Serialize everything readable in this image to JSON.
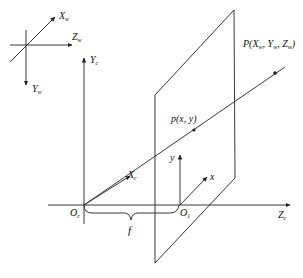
{
  "diagram": {
    "world_axes": {
      "x_label": "X",
      "x_sub": "w",
      "y_label": "Y",
      "y_sub": "w",
      "z_label": "Z",
      "z_sub": "w"
    },
    "camera_axes": {
      "x_label": "X",
      "x_sub": "c",
      "y_label": "Y",
      "y_sub": "c",
      "z_label": "Z",
      "z_sub": "c",
      "origin_label": "O",
      "origin_sub": "c"
    },
    "image_plane": {
      "x_label": "x",
      "y_label": "y",
      "origin_label": "O",
      "origin_sub": "1"
    },
    "points": {
      "world_point": "P(X",
      "world_point_full": "P(Xw, Yw, Zw)",
      "image_point": "p(x, y)"
    },
    "focal_length_label": "f",
    "colors": {
      "line": "#222222",
      "background": "#ffffff"
    }
  }
}
